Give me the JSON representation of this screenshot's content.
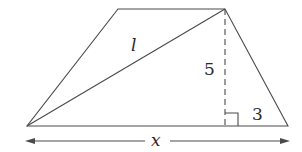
{
  "diagram": {
    "type": "trapezoid-with-diagonal",
    "vertices": {
      "top_left": [
        118,
        9
      ],
      "top_right": [
        225,
        9
      ],
      "bottom_right": [
        288,
        126
      ],
      "bottom_left": [
        27,
        126
      ]
    },
    "labels": {
      "diagonal": "l",
      "height": "5",
      "offset": "3",
      "base": "x"
    },
    "colors": {
      "stroke": "#4a4a4a",
      "text": "#2a2a2a",
      "background": "#ffffff"
    }
  }
}
